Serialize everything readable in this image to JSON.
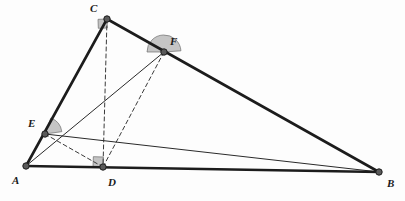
{
  "figure": {
    "background_color": "#fdfdfd",
    "stroke_color": "#1c1c1c",
    "thin_stroke_color": "#2a2a2a",
    "dash_color": "#3a3a3a",
    "marker_fill": "#b8b8b8",
    "marker_stroke": "#6e6e6e",
    "vertex_fill": "#5a5a5a",
    "vertex_stroke": "#1c1c1c"
  },
  "points": [
    {
      "id": "A",
      "label": "A",
      "x": 26,
      "y": 166,
      "label_x": 12,
      "label_y": 175,
      "dot_radius": 3.2
    },
    {
      "id": "B",
      "label": "B",
      "x": 379,
      "y": 172,
      "label_x": 387,
      "label_y": 178,
      "dot_radius": 3.2
    },
    {
      "id": "C",
      "label": "C",
      "x": 107,
      "y": 19,
      "label_x": 90,
      "label_y": 3,
      "dot_radius": 3.2
    },
    {
      "id": "D",
      "label": "D",
      "x": 103,
      "y": 167,
      "label_x": 108,
      "label_y": 177,
      "dot_radius": 3.2
    },
    {
      "id": "E",
      "label": "E",
      "x": 45,
      "y": 134,
      "label_x": 28,
      "label_y": 118,
      "dot_radius": 3.2
    },
    {
      "id": "F",
      "label": "F",
      "x": 164,
      "y": 52,
      "label_x": 170,
      "label_y": 36,
      "dot_radius": 3.2
    }
  ],
  "segments": [
    {
      "id": "AB",
      "from": "A",
      "to": "B",
      "style": "thick-solid",
      "width": 2.6
    },
    {
      "id": "AC",
      "from": "A",
      "to": "C",
      "style": "thick-solid",
      "width": 2.6
    },
    {
      "id": "CB",
      "from": "C",
      "to": "B",
      "style": "thick-solid",
      "width": 2.6
    },
    {
      "id": "AF",
      "from": "A",
      "to": "F",
      "style": "thin-solid",
      "width": 1.0
    },
    {
      "id": "EB",
      "from": "E",
      "to": "B",
      "style": "thin-solid",
      "width": 1.0
    },
    {
      "id": "CD",
      "from": "C",
      "to": "D",
      "style": "dashed",
      "width": 1.0
    },
    {
      "id": "DF",
      "from": "D",
      "to": "F",
      "style": "dashed",
      "width": 1.0
    },
    {
      "id": "ED",
      "from": "E",
      "to": "D",
      "style": "dashed",
      "width": 1.0
    }
  ],
  "angle_markers": [
    {
      "id": "right-angle-at-C",
      "at": "C",
      "type": "right-angle",
      "size": 9,
      "rotate": 178,
      "note": "CD perpendicular to AB"
    },
    {
      "id": "right-angle-at-D",
      "at": "D",
      "type": "right-angle",
      "size": 10,
      "rotate": 272,
      "note": "foot of altitude from C"
    },
    {
      "id": "angle-wedge-at-E",
      "at": "E",
      "type": "sector",
      "radius": 17,
      "start_deg": 8,
      "end_deg": 70,
      "note": "angle between EB and EA region"
    },
    {
      "id": "angle-wedge-at-F",
      "at": "F",
      "type": "sector",
      "radius": 17,
      "start_deg": 4,
      "end_deg": 180,
      "note": "angle below F between FA and FB"
    }
  ]
}
